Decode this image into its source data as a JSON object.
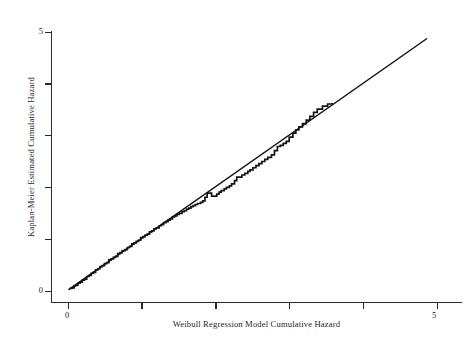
{
  "chart_data": {
    "type": "line",
    "title": "",
    "subtitle": "",
    "xlabel": "Weibull Regression Model Cumulative Hazard",
    "ylabel": "Kaplan-Meier Estimated Cumulative Hazard",
    "xlim": [
      0,
      5.2
    ],
    "ylim": [
      0,
      5.2
    ],
    "grid": false,
    "legend": "none",
    "xticks": [
      0,
      1,
      2,
      3,
      4,
      5
    ],
    "yticks": [
      0,
      1,
      2,
      3,
      4,
      5
    ],
    "xtick_labels": [
      "0",
      "",
      "",
      "",
      "",
      "5"
    ],
    "ytick_labels": [
      "0",
      "",
      "",
      "",
      "",
      "5"
    ],
    "series": [
      {
        "name": "Kaplan-Meier step curve",
        "style": "step",
        "color": "#141414",
        "points": [
          [
            0.03,
            0.04
          ],
          [
            0.06,
            0.05
          ],
          [
            0.09,
            0.09
          ],
          [
            0.11,
            0.1
          ],
          [
            0.14,
            0.14
          ],
          [
            0.17,
            0.16
          ],
          [
            0.2,
            0.2
          ],
          [
            0.23,
            0.22
          ],
          [
            0.26,
            0.27
          ],
          [
            0.29,
            0.29
          ],
          [
            0.32,
            0.33
          ],
          [
            0.35,
            0.35
          ],
          [
            0.38,
            0.4
          ],
          [
            0.41,
            0.42
          ],
          [
            0.44,
            0.46
          ],
          [
            0.47,
            0.48
          ],
          [
            0.5,
            0.52
          ],
          [
            0.53,
            0.54
          ],
          [
            0.56,
            0.59
          ],
          [
            0.59,
            0.61
          ],
          [
            0.62,
            0.64
          ],
          [
            0.65,
            0.66
          ],
          [
            0.68,
            0.71
          ],
          [
            0.71,
            0.73
          ],
          [
            0.74,
            0.77
          ],
          [
            0.78,
            0.79
          ],
          [
            0.81,
            0.83
          ],
          [
            0.84,
            0.85
          ],
          [
            0.87,
            0.9
          ],
          [
            0.9,
            0.92
          ],
          [
            0.93,
            0.95
          ],
          [
            0.96,
            0.97
          ],
          [
            0.99,
            1.02
          ],
          [
            1.02,
            1.04
          ],
          [
            1.05,
            1.07
          ],
          [
            1.08,
            1.09
          ],
          [
            1.11,
            1.13
          ],
          [
            1.14,
            1.15
          ],
          [
            1.17,
            1.19
          ],
          [
            1.2,
            1.21
          ],
          [
            1.24,
            1.25
          ],
          [
            1.27,
            1.27
          ],
          [
            1.3,
            1.31
          ],
          [
            1.33,
            1.33
          ],
          [
            1.36,
            1.36
          ],
          [
            1.39,
            1.38
          ],
          [
            1.42,
            1.42
          ],
          [
            1.45,
            1.44
          ],
          [
            1.48,
            1.47
          ],
          [
            1.51,
            1.49
          ],
          [
            1.55,
            1.52
          ],
          [
            1.58,
            1.54
          ],
          [
            1.61,
            1.57
          ],
          [
            1.64,
            1.59
          ],
          [
            1.67,
            1.62
          ],
          [
            1.7,
            1.64
          ],
          [
            1.73,
            1.66
          ],
          [
            1.76,
            1.68
          ],
          [
            1.8,
            1.7
          ],
          [
            1.83,
            1.73
          ],
          [
            1.86,
            1.8
          ],
          [
            1.89,
            1.88
          ],
          [
            1.92,
            1.88
          ],
          [
            1.95,
            1.82
          ],
          [
            1.99,
            1.82
          ],
          [
            2.02,
            1.86
          ],
          [
            2.05,
            1.9
          ],
          [
            2.08,
            1.93
          ],
          [
            2.12,
            1.96
          ],
          [
            2.15,
            1.99
          ],
          [
            2.19,
            2.02
          ],
          [
            2.22,
            2.06
          ],
          [
            2.26,
            2.12
          ],
          [
            2.29,
            2.19
          ],
          [
            2.33,
            2.19
          ],
          [
            2.36,
            2.23
          ],
          [
            2.4,
            2.26
          ],
          [
            2.44,
            2.3
          ],
          [
            2.47,
            2.33
          ],
          [
            2.51,
            2.37
          ],
          [
            2.55,
            2.41
          ],
          [
            2.59,
            2.45
          ],
          [
            2.63,
            2.49
          ],
          [
            2.67,
            2.53
          ],
          [
            2.71,
            2.57
          ],
          [
            2.76,
            2.62
          ],
          [
            2.8,
            2.7
          ],
          [
            2.84,
            2.78
          ],
          [
            2.88,
            2.8
          ],
          [
            2.92,
            2.84
          ],
          [
            2.96,
            2.88
          ],
          [
            3.0,
            2.96
          ],
          [
            3.05,
            3.04
          ],
          [
            3.09,
            3.1
          ],
          [
            3.13,
            3.16
          ],
          [
            3.18,
            3.22
          ],
          [
            3.23,
            3.29
          ],
          [
            3.28,
            3.36
          ],
          [
            3.33,
            3.44
          ],
          [
            3.38,
            3.5
          ],
          [
            3.45,
            3.56
          ],
          [
            3.52,
            3.6
          ],
          [
            3.58,
            3.62
          ]
        ]
      },
      {
        "name": "45-degree reference line",
        "style": "line",
        "color": "#141414",
        "points": [
          [
            0.02,
            0.02
          ],
          [
            4.86,
            4.86
          ]
        ]
      }
    ]
  },
  "axes": {
    "y_label": "Kaplan-Meier Estimated Cumulative Hazard",
    "x_label": "Weibull Regression Model Cumulative Hazard",
    "x_tick_0": "0",
    "x_tick_5": "5",
    "y_tick_0": "0",
    "y_tick_5": "5"
  },
  "colors": {
    "axis": "#2b2b2b",
    "data": "#141414",
    "background": "#ffffff"
  }
}
